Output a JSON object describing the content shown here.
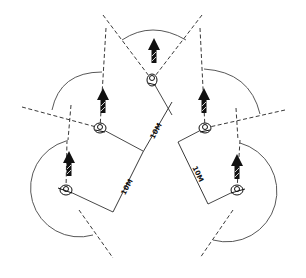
{
  "diagram": {
    "colors": {
      "line": "#222222",
      "background": "#ffffff"
    },
    "dimensions": [
      {
        "label": "10M",
        "position": "left-upper"
      },
      {
        "label": "10M",
        "position": "left-lower"
      },
      {
        "label": "10M",
        "position": "right"
      }
    ],
    "soldiers": [
      {
        "id": "point",
        "x": 152,
        "y": 80
      },
      {
        "id": "left-1",
        "x": 100,
        "y": 128
      },
      {
        "id": "right-1",
        "x": 205,
        "y": 128
      },
      {
        "id": "left-2",
        "x": 66,
        "y": 190
      },
      {
        "id": "right-2",
        "x": 237,
        "y": 190
      }
    ],
    "movement_arrows": 5,
    "icons": [
      "direction-of-movement-arrow-icon",
      "soldier-icon"
    ]
  }
}
